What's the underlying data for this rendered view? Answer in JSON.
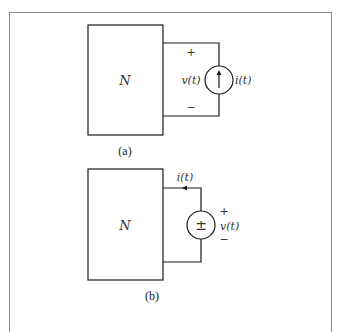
{
  "figure": {
    "panel_a": {
      "caption": "(a)",
      "network_label": "N",
      "source_type": "current-source",
      "voltage_label": "v(t)",
      "current_label": "i(t)",
      "plus_sign": "+",
      "minus_sign": "−"
    },
    "panel_b": {
      "caption": "(b)",
      "network_label": "N",
      "source_type": "voltage-source",
      "source_symbol": "±",
      "voltage_label": "v(t)",
      "current_label": "i(t)",
      "plus_sign": "+",
      "minus_sign": "−"
    }
  }
}
